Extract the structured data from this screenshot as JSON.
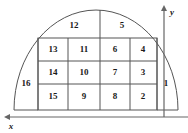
{
  "figure": {
    "shape_type": "semicircular-dome",
    "region_count": 16,
    "line_color": "#555555",
    "label_color": "#1a1a1a",
    "background_color": "#ffffff"
  },
  "axes": {
    "x": {
      "label": "x",
      "direction": "left",
      "label_x": 11,
      "label_y": 127,
      "line_y": 117,
      "line_x1": 6,
      "line_x2": 188,
      "arrow_x": 6
    },
    "y": {
      "label": "y",
      "direction": "up",
      "label_x": 172,
      "label_y": 13,
      "line_x": 164,
      "line_y1": 8,
      "line_y2": 117,
      "arrow_y": 8
    }
  },
  "grid": {
    "left": 38,
    "right": 157,
    "top": 38,
    "bottom": 110,
    "column_lines": [
      38,
      68,
      100,
      130,
      157
    ],
    "row_lines": [
      38,
      61,
      84,
      110
    ],
    "columns": 4,
    "rows": 3
  },
  "arc": {
    "center_x": 96,
    "center_y": 110,
    "radius_x": 82,
    "radius_y": 100,
    "top_divider_x": 100,
    "top_divider_y1": 10,
    "top_divider_y2": 38
  },
  "regions": [
    {
      "id": "1",
      "label": "1",
      "x": 166,
      "y": 84,
      "zone": "right-arc"
    },
    {
      "id": "2",
      "label": "2",
      "x": 143,
      "y": 97,
      "zone": "grid"
    },
    {
      "id": "3",
      "label": "3",
      "x": 143,
      "y": 73,
      "zone": "grid"
    },
    {
      "id": "4",
      "label": "4",
      "x": 143,
      "y": 50,
      "zone": "grid"
    },
    {
      "id": "5",
      "label": "5",
      "x": 122,
      "y": 26,
      "zone": "top-arc"
    },
    {
      "id": "6",
      "label": "6",
      "x": 115,
      "y": 50,
      "zone": "grid"
    },
    {
      "id": "7",
      "label": "7",
      "x": 115,
      "y": 73,
      "zone": "grid"
    },
    {
      "id": "8",
      "label": "8",
      "x": 115,
      "y": 97,
      "zone": "grid"
    },
    {
      "id": "9",
      "label": "9",
      "x": 84,
      "y": 97,
      "zone": "grid"
    },
    {
      "id": "10",
      "label": "10",
      "x": 84,
      "y": 73,
      "zone": "grid"
    },
    {
      "id": "11",
      "label": "11",
      "x": 84,
      "y": 50,
      "zone": "grid"
    },
    {
      "id": "12",
      "label": "12",
      "x": 74,
      "y": 26,
      "zone": "top-arc"
    },
    {
      "id": "13",
      "label": "13",
      "x": 53,
      "y": 50,
      "zone": "grid"
    },
    {
      "id": "14",
      "label": "14",
      "x": 53,
      "y": 73,
      "zone": "grid"
    },
    {
      "id": "15",
      "label": "15",
      "x": 53,
      "y": 97,
      "zone": "grid"
    },
    {
      "id": "16",
      "label": "16",
      "x": 26,
      "y": 84,
      "zone": "left-arc"
    }
  ]
}
